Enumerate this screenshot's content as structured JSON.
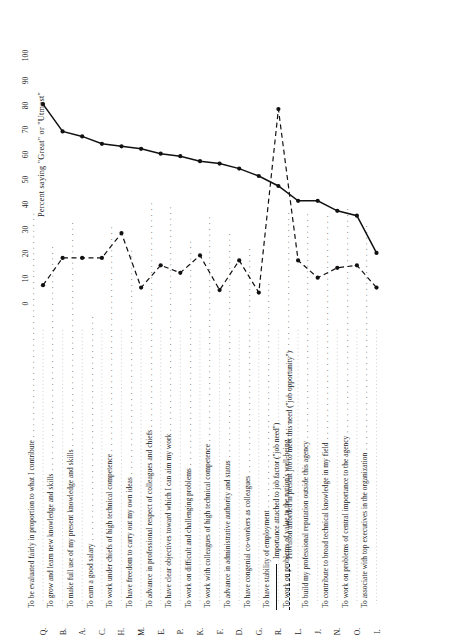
{
  "figure": {
    "value_axis_title": "Percent saying \"Great\" or \"Utmost\"",
    "ticks": [
      0,
      10,
      20,
      30,
      40,
      50,
      60,
      70,
      80,
      90,
      100
    ]
  },
  "legend": {
    "items": [
      {
        "key": "solid",
        "label": "Importance attached to job factor (\"job need\")"
      },
      {
        "key": "dashed",
        "label": "Provision afforded in present job to meet this need (\"job opportunity\")"
      }
    ]
  },
  "chart_data": {
    "type": "line",
    "title": "",
    "xlabel": "",
    "ylabel": "Percent saying \"Great\" or \"Utmost\"",
    "ylim": [
      0,
      100
    ],
    "grid": false,
    "legend_position": "bottom-right",
    "orientation": "rotated-90",
    "codes": [
      "Q",
      "B",
      "A",
      "C",
      "H",
      "M",
      "E",
      "P",
      "K",
      "F",
      "D",
      "G",
      "R",
      "L",
      "J",
      "N",
      "O",
      "I"
    ],
    "categories": [
      "To be evaluated fairly in proportion to what I contribute",
      "To grow and learn new knowledge and skills",
      "To make full use of my present knowledge and skills",
      "To earn a good salary",
      "To work under chiefs of high technical competence",
      "To have freedom to carry out my own ideas",
      "To advance in professional respect of colleagues and chiefs",
      "To have clear objectives toward which I can aim my work",
      "To work on difficult and challenging problems",
      "To work with colleagues of high technical competence",
      "To advance in administrative authority and status",
      "To have congenial co-workers as colleagues",
      "To have stability of employment",
      "To work on problems of value to the nation's well-being",
      "To build my professional reputation outside this agency",
      "To contribute to broad technical knowledge in my field",
      "To work on problems of central importance to the agency",
      "To associate with top executives in the organization"
    ],
    "series": [
      {
        "name": "Importance attached to job factor (\"job need\")",
        "style": "solid",
        "values": [
          81,
          70,
          68,
          65,
          64,
          63,
          61,
          60,
          58,
          57,
          55,
          52,
          48,
          42,
          42,
          38,
          36,
          21
        ]
      },
      {
        "name": "Provision afforded in present job to meet this need (\"job opportunity\")",
        "style": "dashed",
        "values": [
          8,
          19,
          19,
          19,
          29,
          7,
          16,
          13,
          20,
          6,
          18,
          5,
          79,
          18,
          11,
          15,
          16,
          7
        ]
      }
    ]
  }
}
